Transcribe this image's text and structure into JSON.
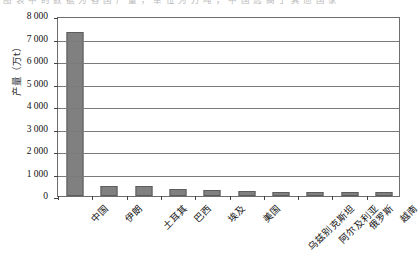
{
  "top_caption": "图 表 中 的 数 据 为 各 国 产 量 ， 单 位 为 万 吨 ， 中 国 远 高 于 其 他 国 家",
  "chart_data": {
    "type": "bar",
    "title": "",
    "xlabel": "",
    "ylabel": "产量（万t）",
    "categories": [
      "中国",
      "伊朗",
      "土耳其",
      "巴西",
      "埃及",
      "美国",
      "乌兹别克斯坦",
      "阿尔及利亚",
      "俄罗斯",
      "越南"
    ],
    "values": [
      7300,
      430,
      430,
      300,
      250,
      220,
      180,
      170,
      170,
      160
    ],
    "ylim": [
      0,
      8000
    ],
    "ytick_step": 1000,
    "ytick_labels": [
      "8 000",
      "7 000",
      "6 000",
      "5 000",
      "4 000",
      "3 000",
      "2 000",
      "1 000",
      "0"
    ],
    "ytick_values": [
      8000,
      7000,
      6000,
      5000,
      4000,
      3000,
      2000,
      1000,
      0
    ],
    "grid": true,
    "legend": false,
    "series_color": "#808080",
    "axis_color": "#6e6e6e",
    "plot_background": "#ffffff"
  }
}
